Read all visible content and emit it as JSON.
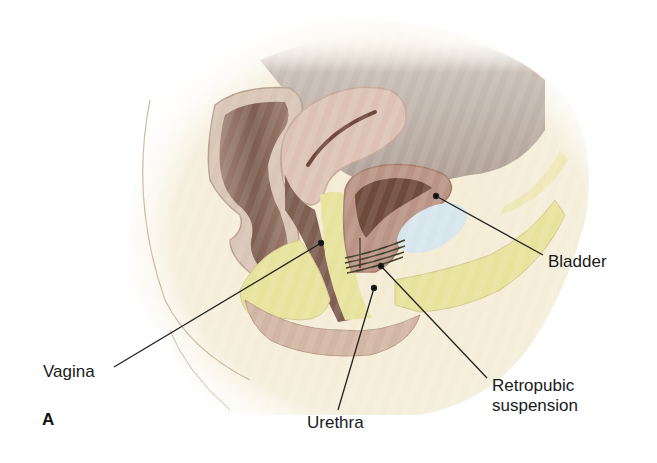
{
  "figure": {
    "panel_letter": "A",
    "labels": {
      "bladder": "Bladder",
      "vagina": "Vagina",
      "urethra": "Urethra",
      "retropubic_line1": "Retropubic",
      "retropubic_line2": "suspension"
    },
    "colors": {
      "background": "#ffffff",
      "body_cream": "#f4ecd2",
      "cavity_gray": "#b8aca2",
      "rectum_brown": "#8a6a5e",
      "rectum_wall": "#d9c6b6",
      "uterus_pink": "#d8bdb0",
      "fat_yellow": "#e6e39a",
      "bladder_wall": "#b99484",
      "bladder_lumen": "#6e4a3c",
      "space_of_retzius": "#d6e4ea",
      "leader_line": "#222222"
    }
  }
}
